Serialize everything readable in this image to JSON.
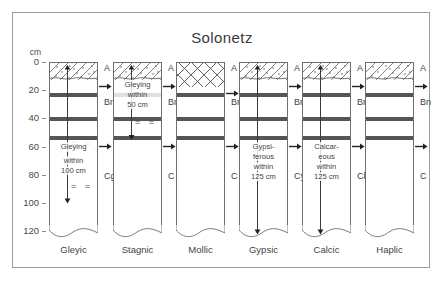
{
  "figure": {
    "title": "Solonetz",
    "axis_unit": "cm",
    "depth_ticks": [
      "0",
      "20",
      "40",
      "60",
      "80",
      "100",
      "120"
    ],
    "depth_values": [
      0,
      20,
      40,
      60,
      80,
      100,
      120
    ]
  },
  "columns": [
    {
      "caption": "Gleyic",
      "topsoil_pattern": "diagonal-hatch-dots",
      "horizons": [
        {
          "label": "A",
          "depth_top": 0,
          "depth_bottom": 12
        },
        {
          "label": "Bn",
          "depth_top": 12,
          "depth_bottom": 55
        },
        {
          "label": "Cg",
          "depth_top": 55,
          "depth_bottom": 120
        }
      ],
      "note": "Gleying within 100 cm",
      "note_lines": [
        "Gleying",
        "within",
        "100 cm"
      ],
      "marker": "gley-equals",
      "arrow_depth_cm": 100
    },
    {
      "caption": "Stagnic",
      "topsoil_pattern": "diagonal-hatch-dots",
      "horizons": [
        {
          "label": "A",
          "depth_top": 0,
          "depth_bottom": 12
        },
        {
          "label": "Bng",
          "depth_top": 12,
          "depth_bottom": 55
        },
        {
          "label": "C",
          "depth_top": 55,
          "depth_bottom": 120
        }
      ],
      "note": "Gleying within 50 cm",
      "note_lines": [
        "Gleying",
        "within",
        "50 cm"
      ],
      "marker": "gley-equals",
      "arrow_depth_cm": 55
    },
    {
      "caption": "Mollic",
      "topsoil_pattern": "cross-hatch",
      "horizons": [
        {
          "label": "A",
          "depth_top": 0,
          "depth_bottom": 17
        },
        {
          "label": "Bn",
          "depth_top": 17,
          "depth_bottom": 55
        },
        {
          "label": "C",
          "depth_top": 55,
          "depth_bottom": 120
        }
      ],
      "note": "",
      "note_lines": [],
      "marker": "none",
      "arrow_depth_cm": null
    },
    {
      "caption": "Gypsic",
      "topsoil_pattern": "diagonal-hatch-dots",
      "horizons": [
        {
          "label": "A",
          "depth_top": 0,
          "depth_bottom": 12
        },
        {
          "label": "Bn",
          "depth_top": 12,
          "depth_bottom": 55
        },
        {
          "label": "Cy",
          "depth_top": 55,
          "depth_bottom": 120
        }
      ],
      "note": "Gypsiferous within 125 cm",
      "note_lines": [
        "Gypsi-",
        "ferous",
        "within",
        "125 cm"
      ],
      "marker": "none",
      "arrow_depth_cm": 122
    },
    {
      "caption": "Calcic",
      "topsoil_pattern": "diagonal-hatch-dots",
      "horizons": [
        {
          "label": "A",
          "depth_top": 0,
          "depth_bottom": 12
        },
        {
          "label": "Bn",
          "depth_top": 12,
          "depth_bottom": 55
        },
        {
          "label": "Ck",
          "depth_top": 55,
          "depth_bottom": 120
        }
      ],
      "note": "Calcareous within 125 cm",
      "note_lines": [
        "Calcar-",
        "eous",
        "within",
        "125 cm"
      ],
      "marker": "none",
      "arrow_depth_cm": 122
    },
    {
      "caption": "Haplic",
      "topsoil_pattern": "diagonal-hatch-dots",
      "horizons": [
        {
          "label": "A",
          "depth_top": 0,
          "depth_bottom": 12
        },
        {
          "label": "Bn",
          "depth_top": 12,
          "depth_bottom": 55
        },
        {
          "label": "C",
          "depth_top": 55,
          "depth_bottom": 120
        }
      ],
      "note": "",
      "note_lines": [],
      "marker": "none",
      "arrow_depth_cm": null
    }
  ],
  "bands": {
    "label": "natric-columnar-bands",
    "depths_cm": [
      [
        21,
        24.5
      ],
      [
        38,
        41
      ],
      [
        52,
        55
      ]
    ]
  },
  "colors": {
    "frame": "#9a9a9a",
    "outline": "#6f6f6f",
    "band": "#555555",
    "text": "#3f3f3f"
  }
}
